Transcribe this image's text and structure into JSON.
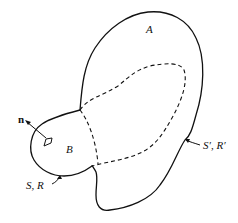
{
  "diagram": {
    "type": "region-boundary-sketch",
    "regions": [
      {
        "id": "A",
        "label": "A"
      },
      {
        "id": "B",
        "label": "B"
      }
    ],
    "labels": {
      "region_a": "A",
      "region_b": "B",
      "normal_vector": "n",
      "surface_inner": "S, R",
      "surface_outer": "S′, R′"
    },
    "colors": {
      "stroke": "#111111",
      "background": "#ffffff"
    }
  }
}
